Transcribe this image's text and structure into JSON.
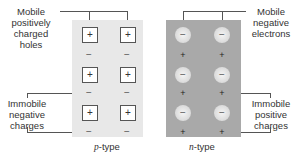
{
  "labels": {
    "mobile_holes": [
      "Mobile",
      "positively",
      "charged",
      "holes"
    ],
    "immobile_negative": [
      "Immobile",
      "negative",
      "charges"
    ],
    "mobile_electrons": [
      "Mobile",
      "negative",
      "electrons"
    ],
    "immobile_positive": [
      "Immobile",
      "positive",
      "charges"
    ]
  },
  "panels": {
    "p": {
      "caption_italic": "p",
      "caption_rest": "-type",
      "color": "#e8e8e8",
      "mobile_symbol": "+",
      "fixed_symbol": "−"
    },
    "n": {
      "caption_italic": "n",
      "caption_rest": "-type",
      "color": "#a9a9a9",
      "mobile_symbol": "−",
      "fixed_symbol": "+"
    }
  }
}
